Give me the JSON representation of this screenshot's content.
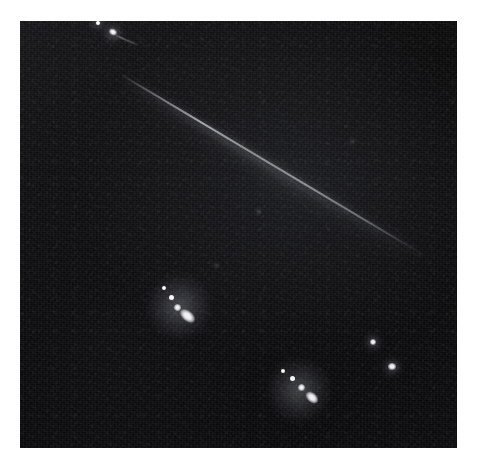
{
  "image": {
    "kind": "astronomical-field-photograph",
    "caption": "Dark astronomical field with a faint diagonal trail and several bright point sources",
    "frame": {
      "background_color": "#ffffff",
      "plate_color": "#050505",
      "plate_left": 20,
      "plate_top": 21,
      "plate_width": 437,
      "plate_height": 427
    },
    "palette": {
      "background": "#ffffff",
      "sky_dark": "#050505",
      "sky_mid": "#1a1b20",
      "sky_light": "#2a2c33",
      "source_white": "#ffffff",
      "trail_grey": "#d2d4dc"
    },
    "features": {
      "trail": {
        "name": "diagonal-trail",
        "description": "faint elongated streak crossing the frame from upper-left to lower-right",
        "start_x": 100,
        "start_y": 52,
        "end_x": 404,
        "end_y": 233,
        "angle_deg": 30.8,
        "length": 354,
        "peak_brightness": 0.62
      },
      "point_sources": [
        {
          "name": "source-top-edge",
          "x": 77,
          "y": 1,
          "size": 4,
          "brightness": 0.95,
          "shape": "point"
        },
        {
          "name": "source-upper-left",
          "x": 92,
          "y": 11,
          "size": 6,
          "brightness": 1.0,
          "shape": "elongated",
          "angle_deg": 28
        },
        {
          "name": "source-upper-tail",
          "x": 101,
          "y": 15,
          "size": 9,
          "brightness": 0.45,
          "shape": "tail",
          "angle_deg": 28
        },
        {
          "name": "cluster-a-dot-1",
          "x": 144,
          "y": 267,
          "size": 4,
          "brightness": 0.8,
          "shape": "point"
        },
        {
          "name": "cluster-a-dot-2",
          "x": 151,
          "y": 276,
          "size": 5,
          "brightness": 0.88,
          "shape": "point"
        },
        {
          "name": "cluster-a-dot-3",
          "x": 157,
          "y": 286,
          "size": 6,
          "brightness": 0.92,
          "shape": "point"
        },
        {
          "name": "cluster-a-core",
          "x": 165,
          "y": 296,
          "size": 14,
          "brightness": 1.0,
          "shape": "elongated",
          "angle_deg": 40
        },
        {
          "name": "cluster-b-dot-1",
          "x": 263,
          "y": 350,
          "size": 4,
          "brightness": 0.72,
          "shape": "point"
        },
        {
          "name": "cluster-b-dot-2",
          "x": 272,
          "y": 357,
          "size": 5,
          "brightness": 0.85,
          "shape": "point"
        },
        {
          "name": "cluster-b-dot-3",
          "x": 281,
          "y": 366,
          "size": 6,
          "brightness": 0.9,
          "shape": "point"
        },
        {
          "name": "cluster-b-core",
          "x": 290,
          "y": 377,
          "size": 12,
          "brightness": 1.0,
          "shape": "elongated",
          "angle_deg": 42
        },
        {
          "name": "source-right-upper",
          "x": 352,
          "y": 320,
          "size": 6,
          "brightness": 0.9,
          "shape": "point"
        },
        {
          "name": "source-right-lower",
          "x": 371,
          "y": 345,
          "size": 7,
          "brightness": 0.95,
          "shape": "point"
        },
        {
          "name": "source-faint-mid",
          "x": 238,
          "y": 190,
          "size": 3,
          "brightness": 0.35,
          "shape": "point"
        },
        {
          "name": "source-faint-right",
          "x": 332,
          "y": 120,
          "size": 3,
          "brightness": 0.3,
          "shape": "point"
        },
        {
          "name": "source-faint-low",
          "x": 196,
          "y": 244,
          "size": 3,
          "brightness": 0.3,
          "shape": "point"
        }
      ]
    }
  }
}
